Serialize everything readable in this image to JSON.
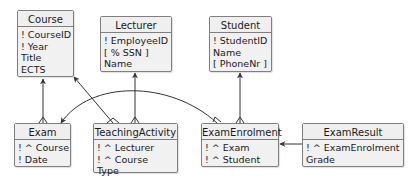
{
  "diagram": {
    "type": "entity-relationship",
    "entities": [
      {
        "id": "course",
        "name": "Course",
        "attributes": [
          "! CourseID",
          "! Year",
          "Title",
          "ECTS"
        ]
      },
      {
        "id": "lecturer",
        "name": "Lecturer",
        "attributes": [
          "! EmployeeID",
          "[ % SSN ]",
          "Name"
        ]
      },
      {
        "id": "student",
        "name": "Student",
        "attributes": [
          "! StudentID",
          "Name",
          "[ PhoneNr ]"
        ]
      },
      {
        "id": "exam",
        "name": "Exam",
        "attributes": [
          "! ^ Course",
          "! Date"
        ]
      },
      {
        "id": "teachingactivity",
        "name": "TeachingActivity",
        "attributes": [
          "! ^ Lecturer",
          "! ^ Course",
          "Type"
        ]
      },
      {
        "id": "examenrolment",
        "name": "ExamEnrolment",
        "attributes": [
          "! ^ Exam",
          "! ^ Student"
        ]
      },
      {
        "id": "examresult",
        "name": "ExamResult",
        "attributes": [
          "! ^ ExamEnrolment",
          "Grade"
        ]
      }
    ],
    "relationships": [
      {
        "from": "Exam",
        "to": "Course",
        "from_end": "crows-foot",
        "to_end": "arrow"
      },
      {
        "from": "TeachingActivity",
        "to": "Course",
        "from_end": "crows-foot",
        "to_end": "arrow"
      },
      {
        "from": "TeachingActivity",
        "to": "Lecturer",
        "from_end": "crows-foot",
        "to_end": "arrow"
      },
      {
        "from": "ExamEnrolment",
        "to": "Exam",
        "from_end": "crows-foot",
        "to_end": "arrow"
      },
      {
        "from": "ExamEnrolment",
        "to": "Student",
        "from_end": "crows-foot",
        "to_end": "arrow"
      },
      {
        "from": "ExamResult",
        "to": "ExamEnrolment",
        "from_end": "line",
        "to_end": "arrow"
      }
    ],
    "colors": {
      "box_fill": "#f1f1f1",
      "box_border": "#7f7f7f",
      "edge": "#333333",
      "text": "#1a1a1a"
    }
  }
}
